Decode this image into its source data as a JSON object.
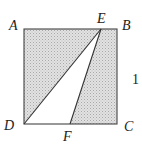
{
  "figure": {
    "shape": "square",
    "side_length_label": "1",
    "vertices": {
      "A": "A",
      "B": "B",
      "C": "C",
      "D": "D",
      "E": "E",
      "F": "F"
    },
    "unshaded_region": "triangle DEF",
    "shaded_region": "square ABCD minus triangle DEF",
    "colors": {
      "shade": "#d4d4d4",
      "stroke": "#333333",
      "unshaded": "#ffffff"
    }
  }
}
